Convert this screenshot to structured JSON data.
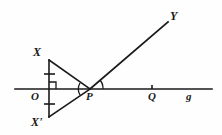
{
  "figure": {
    "kind": "geometry-diagram",
    "width": 222,
    "height": 135,
    "background_color": "#fefefe",
    "stroke_color": "#1a1a1a"
  },
  "labels": {
    "x_upper": "X",
    "x_lower": "X'",
    "origin": "O",
    "point_p": "P",
    "point_q": "Q",
    "line_g": "g",
    "ray_y": "Y"
  },
  "points": {
    "O": {
      "x": 49,
      "y": 89
    },
    "X": {
      "x": 49,
      "y": 60
    },
    "Xp": {
      "x": 49,
      "y": 117
    },
    "P": {
      "x": 90,
      "y": 89
    },
    "Q": {
      "x": 152,
      "y": 89
    },
    "Y": {
      "x": 168,
      "y": 22
    }
  },
  "segments": [
    {
      "name": "line-g",
      "from": [
        15,
        89
      ],
      "to": [
        212,
        89
      ]
    },
    {
      "name": "segment-XX'",
      "from": [
        49,
        60
      ],
      "to": [
        49,
        117
      ]
    },
    {
      "name": "segment-XP",
      "from": [
        49,
        60
      ],
      "to": [
        90,
        89
      ]
    },
    {
      "name": "segment-X'P",
      "from": [
        49,
        117
      ],
      "to": [
        90,
        89
      ]
    },
    {
      "name": "ray-PY",
      "from": [
        90,
        89
      ],
      "to": [
        168,
        22
      ]
    }
  ],
  "marks": {
    "right_angle_at_O": true,
    "congruence_ticks": 2,
    "tick_at_Q": true,
    "angle_arcs_at_P": 2
  }
}
